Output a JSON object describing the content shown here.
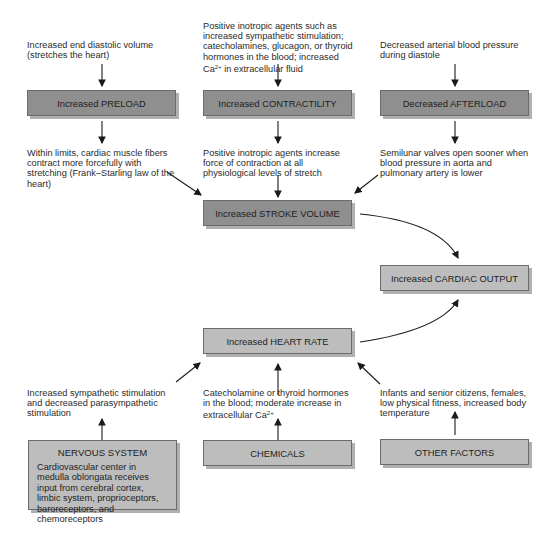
{
  "top_inputs": {
    "preload_cause": "Increased end diastolic volume (stretches the heart)",
    "contractility_cause_a": "Positive inotropic agents such as increased sympathetic stimulation; catecholamines, glucagon, or thyroid hormones in the blood; increased Ca",
    "contractility_cause_sup": "2+",
    "contractility_cause_b": " in extracellular fluid",
    "afterload_cause": "Decreased arterial blood pressure during diastole"
  },
  "boxes": {
    "preload": "Increased PRELOAD",
    "contractility": "Increased CONTRACTILITY",
    "afterload": "Decreased AFTERLOAD",
    "stroke_volume": "Increased STROKE VOLUME",
    "cardiac_output": "Increased CARDIAC OUTPUT",
    "heart_rate": "Increased HEART RATE",
    "nervous_system_title": "NERVOUS SYSTEM",
    "nervous_system_body": "Cardiovascular center in medulla oblongata receives input from cerebral cortex, limbic system, proprioceptors, baroreceptors, and chemoreceptors",
    "chemicals": "CHEMICALS",
    "other_factors": "OTHER FACTORS"
  },
  "effects": {
    "preload_effect": "Within limits, cardiac muscle fibers contract more forcefully with stretching (Frank–Starling law of the heart)",
    "contractility_effect": "Positive inotropic agents increase force of contraction at all physiological levels of stretch",
    "afterload_effect": "Semilunar valves open sooner when blood pressure in aorta and pulmonary artery is lower"
  },
  "bottom_inputs": {
    "nervous_effect": "Increased sympathetic stimulation and decreased parasympathetic stimulation",
    "chemicals_effect_a": "Catecholamine or thyroid hormones in the blood; moderate increase in extracellular Ca",
    "chemicals_effect_sup": "2+",
    "other_effect": "Infants and senior citizens, females, low physical fitness, increased body temperature"
  },
  "colors": {
    "dark_box": "#8f8f8f",
    "light_box": "#bdbdbd",
    "arrow": "#1a1a1a"
  }
}
